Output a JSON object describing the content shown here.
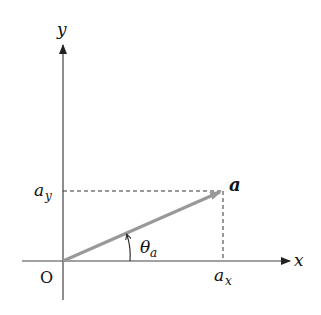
{
  "diagram": {
    "axes": {
      "x_label": "x",
      "y_label": "y",
      "origin_label": "O"
    },
    "vector": {
      "label": "a",
      "color": "#999999"
    },
    "components": {
      "x_component_label_base": "a",
      "x_component_label_sub": "x",
      "y_component_label_base": "a",
      "y_component_label_sub": "y"
    },
    "angle": {
      "label_base": "θ",
      "label_sub": "a"
    },
    "colors": {
      "axis": "#333333",
      "dash": "#333333",
      "vector": "#999999"
    }
  }
}
